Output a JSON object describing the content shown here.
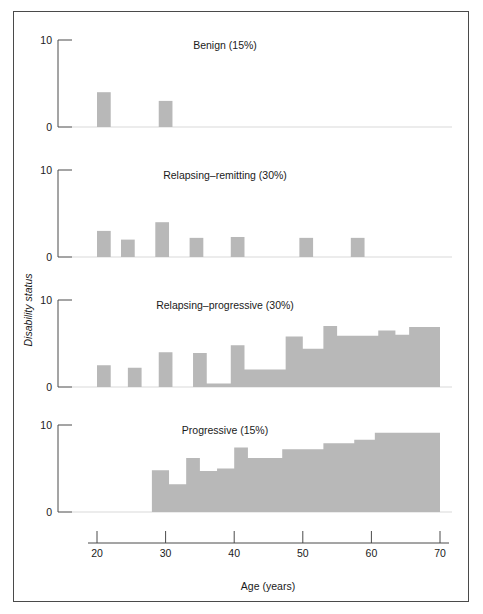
{
  "figure": {
    "y_axis_label": "Disability status",
    "x_axis_label": "Age (years)"
  },
  "chart_data": {
    "type": "bar",
    "title": "",
    "subtitle": "",
    "xlabel": "Age (years)",
    "ylabel": "Disability status",
    "xlim": [
      18,
      72
    ],
    "ylim": [
      0,
      10
    ],
    "xticks": [
      20,
      30,
      40,
      50,
      60,
      70
    ],
    "xticklabels": [
      "20",
      "30",
      "40",
      "50",
      "60",
      "70"
    ],
    "yticks": [
      0,
      10
    ],
    "yticklabels": [
      "0",
      "10"
    ],
    "grid": false,
    "legend": "none",
    "bar_color": "#b8b8b8",
    "panel_layout": "4 stacked subpanels sharing one x-axis",
    "panels": [
      {
        "name": "benign",
        "label": "Benign (15%)",
        "percent": 15,
        "ylim": [
          0,
          10
        ],
        "yticklabels": [
          "0",
          "10"
        ],
        "bars": [
          {
            "age_start": 20,
            "age_end": 22,
            "value": 4.0
          },
          {
            "age_start": 29,
            "age_end": 31,
            "value": 3.0
          }
        ]
      },
      {
        "name": "relapsing-remitting",
        "label": "Relapsing–remitting (30%)",
        "percent": 30,
        "ylim": [
          0,
          10
        ],
        "yticklabels": [
          "0",
          "10"
        ],
        "bars": [
          {
            "age_start": 20,
            "age_end": 22,
            "value": 3.0
          },
          {
            "age_start": 23.5,
            "age_end": 25.5,
            "value": 2.0
          },
          {
            "age_start": 28.5,
            "age_end": 30.5,
            "value": 4.0
          },
          {
            "age_start": 33.5,
            "age_end": 35.5,
            "value": 2.2
          },
          {
            "age_start": 39.5,
            "age_end": 41.5,
            "value": 2.3
          },
          {
            "age_start": 49.5,
            "age_end": 51.5,
            "value": 2.2
          },
          {
            "age_start": 57,
            "age_end": 59,
            "value": 2.2
          }
        ]
      },
      {
        "name": "relapsing-progressive",
        "label": "Relapsing–progressive (30%)",
        "percent": 30,
        "ylim": [
          0,
          10
        ],
        "yticklabels": [
          "0",
          "10"
        ],
        "steps": [
          {
            "age_start": 20,
            "age_end": 22,
            "value": 2.5
          },
          {
            "age_start": 22,
            "age_end": 24.5,
            "value": 0
          },
          {
            "age_start": 24.5,
            "age_end": 26.5,
            "value": 2.2
          },
          {
            "age_start": 26.5,
            "age_end": 29,
            "value": 0
          },
          {
            "age_start": 29,
            "age_end": 31,
            "value": 4.0
          },
          {
            "age_start": 31,
            "age_end": 34,
            "value": 0
          },
          {
            "age_start": 34,
            "age_end": 36,
            "value": 3.9
          },
          {
            "age_start": 36,
            "age_end": 39.5,
            "value": 0.4
          },
          {
            "age_start": 39.5,
            "age_end": 41.5,
            "value": 4.8
          },
          {
            "age_start": 41.5,
            "age_end": 47.5,
            "value": 2.0
          },
          {
            "age_start": 47.5,
            "age_end": 50,
            "value": 5.8
          },
          {
            "age_start": 50,
            "age_end": 53,
            "value": 4.4
          },
          {
            "age_start": 53,
            "age_end": 55,
            "value": 7.0
          },
          {
            "age_start": 55,
            "age_end": 61,
            "value": 5.9
          },
          {
            "age_start": 61,
            "age_end": 63.5,
            "value": 6.5
          },
          {
            "age_start": 63.5,
            "age_end": 65.5,
            "value": 6.0
          },
          {
            "age_start": 65.5,
            "age_end": 70,
            "value": 6.9
          }
        ]
      },
      {
        "name": "progressive",
        "label": "Progressive (15%)",
        "percent": 15,
        "ylim": [
          0,
          10
        ],
        "yticklabels": [
          "0",
          "10"
        ],
        "steps": [
          {
            "age_start": 28,
            "age_end": 30.5,
            "value": 4.8
          },
          {
            "age_start": 30.5,
            "age_end": 33,
            "value": 3.2
          },
          {
            "age_start": 33,
            "age_end": 35,
            "value": 6.2
          },
          {
            "age_start": 35,
            "age_end": 37.5,
            "value": 4.7
          },
          {
            "age_start": 37.5,
            "age_end": 40,
            "value": 5.0
          },
          {
            "age_start": 40,
            "age_end": 42,
            "value": 7.4
          },
          {
            "age_start": 42,
            "age_end": 47,
            "value": 6.2
          },
          {
            "age_start": 47,
            "age_end": 53,
            "value": 7.2
          },
          {
            "age_start": 53,
            "age_end": 57.5,
            "value": 7.9
          },
          {
            "age_start": 57.5,
            "age_end": 60.5,
            "value": 8.3
          },
          {
            "age_start": 60.5,
            "age_end": 70,
            "value": 9.1
          }
        ]
      }
    ]
  }
}
